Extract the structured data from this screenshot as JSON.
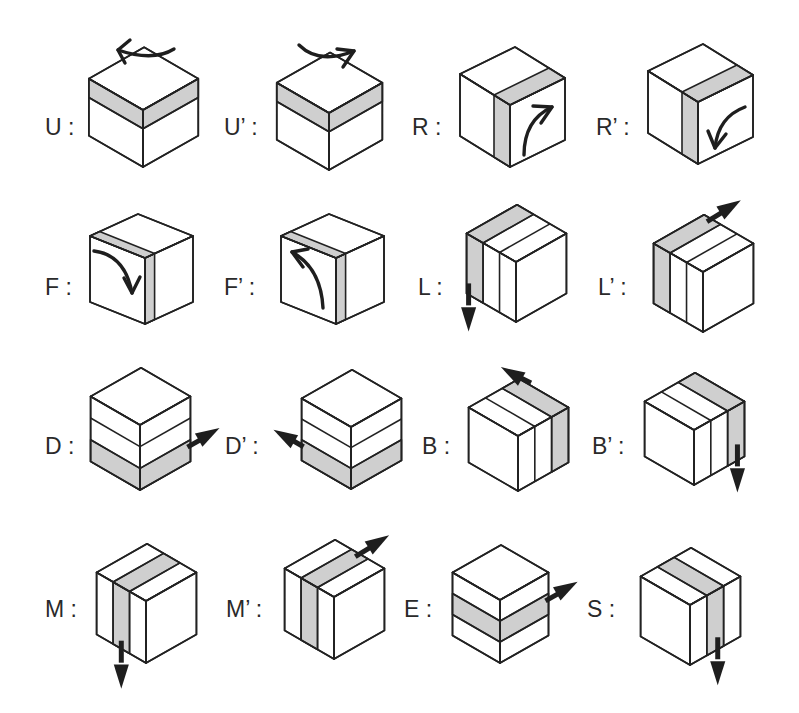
{
  "colors": {
    "edge": "#222222",
    "face": "#ffffff",
    "highlight": "#cfcfcf",
    "arrow": "#1e1e1e",
    "label": "#2a2a2a"
  },
  "moves": [
    {
      "id": "U",
      "label": "U :",
      "lx": 45,
      "ly": 116,
      "view": "iso",
      "ox": 143,
      "oy": 110,
      "s": 57,
      "h": 57,
      "hi": "top-layer",
      "slices": "layers3",
      "arrow": {
        "type": "curve",
        "dir": "U"
      }
    },
    {
      "id": "U'",
      "label": "U’ :",
      "lx": 224,
      "ly": 116,
      "view": "iso",
      "ox": 329,
      "oy": 113,
      "s": 55,
      "h": 57,
      "hi": "top-layer",
      "slices": "layers3",
      "arrow": {
        "type": "curve",
        "dir": "U'"
      }
    },
    {
      "id": "R",
      "label": "R :",
      "lx": 412,
      "ly": 116,
      "view": "rotR",
      "ox": 510,
      "oy": 105,
      "s": 55,
      "h": 62,
      "hi": "right-col",
      "slices": "none",
      "arrow": {
        "type": "curve",
        "dir": "R"
      }
    },
    {
      "id": "R'",
      "label": "R’ :",
      "lx": 596,
      "ly": 116,
      "view": "rotR",
      "ox": 698,
      "oy": 102,
      "s": 55,
      "h": 62,
      "hi": "right-col",
      "slices": "none",
      "arrow": {
        "type": "curve",
        "dir": "R'"
      }
    },
    {
      "id": "F",
      "label": "F :",
      "lx": 45,
      "ly": 276,
      "view": "rotL",
      "ox": 145,
      "oy": 258,
      "s": 55,
      "h": 66,
      "hi": "front-col",
      "slices": "none",
      "arrow": {
        "type": "curve",
        "dir": "F"
      }
    },
    {
      "id": "F'",
      "label": "F’ :",
      "lx": 224,
      "ly": 276,
      "view": "rotL",
      "ox": 336,
      "oy": 258,
      "s": 55,
      "h": 66,
      "hi": "front-col",
      "slices": "none",
      "arrow": {
        "type": "curve",
        "dir": "F'"
      }
    },
    {
      "id": "L",
      "label": "L :",
      "lx": 418,
      "ly": 276,
      "view": "iso",
      "ox": 516,
      "oy": 262,
      "s": 52,
      "h": 60,
      "hi": "left-slice",
      "slices": "cols3",
      "arrow": {
        "type": "straight",
        "dir": "down"
      }
    },
    {
      "id": "L'",
      "label": "L’ :",
      "lx": 598,
      "ly": 276,
      "view": "iso",
      "ox": 703,
      "oy": 272,
      "s": 52,
      "h": 60,
      "hi": "left-slice",
      "slices": "cols3",
      "arrow": {
        "type": "straight",
        "dir": "upright"
      }
    },
    {
      "id": "D",
      "label": "D :",
      "lx": 45,
      "ly": 435,
      "view": "iso",
      "ox": 140,
      "oy": 425,
      "s": 52,
      "h": 65,
      "hi": "bottom-layer",
      "slices": "layers3",
      "arrow": {
        "type": "straight",
        "dir": "right"
      }
    },
    {
      "id": "D'",
      "label": "D’ :",
      "lx": 225,
      "ly": 435,
      "view": "iso",
      "ox": 351,
      "oy": 427,
      "s": 52,
      "h": 62,
      "hi": "bottom-layer",
      "slices": "layers3",
      "arrow": {
        "type": "straight",
        "dir": "left"
      }
    },
    {
      "id": "B",
      "label": "B :",
      "lx": 422,
      "ly": 435,
      "view": "iso",
      "ox": 518,
      "oy": 436,
      "s": 52,
      "h": 55,
      "hi": "back-slice",
      "slices": "rcols3",
      "arrow": {
        "type": "straight",
        "dir": "upleft"
      }
    },
    {
      "id": "B'",
      "label": "B’ :",
      "lx": 592,
      "ly": 435,
      "view": "iso",
      "ox": 694,
      "oy": 430,
      "s": 52,
      "h": 55,
      "hi": "back-slice",
      "slices": "rcols3",
      "arrow": {
        "type": "straight",
        "dir": "down"
      }
    },
    {
      "id": "M",
      "label": "M :",
      "lx": 45,
      "ly": 598,
      "view": "iso",
      "ox": 146,
      "oy": 601,
      "s": 52,
      "h": 62,
      "hi": "middle-slice",
      "slices": "cols3",
      "arrow": {
        "type": "straight",
        "dir": "down"
      }
    },
    {
      "id": "M'",
      "label": "M’ :",
      "lx": 226,
      "ly": 598,
      "view": "iso",
      "ox": 334,
      "oy": 597,
      "s": 52,
      "h": 62,
      "hi": "middle-slice",
      "slices": "cols3",
      "arrow": {
        "type": "straight",
        "dir": "upright"
      }
    },
    {
      "id": "E",
      "label": "E :",
      "lx": 404,
      "ly": 598,
      "view": "iso",
      "ox": 500,
      "oy": 600,
      "s": 50,
      "h": 63,
      "hi": "middle-layer",
      "slices": "layers3",
      "arrow": {
        "type": "straight",
        "dir": "right"
      }
    },
    {
      "id": "S",
      "label": "S :",
      "lx": 587,
      "ly": 598,
      "view": "iso",
      "ox": 690,
      "oy": 605,
      "s": 52,
      "h": 60,
      "hi": "middle-rslice",
      "slices": "rcols3",
      "arrow": {
        "type": "straight",
        "dir": "down"
      }
    }
  ]
}
